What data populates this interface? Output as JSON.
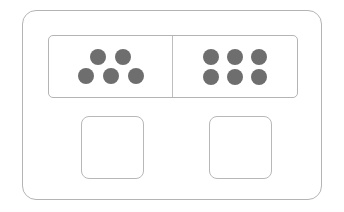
{
  "card": {
    "name": "dot-comparison-card",
    "border_color": "#b4b4b4",
    "background_color": "#ffffff"
  },
  "dot_strip": {
    "name": "dot-strip",
    "divider_color": "#bdbdbd",
    "dot_color": "#6e6e6e",
    "cells": [
      {
        "id": "left",
        "name": "left-dot-group",
        "count": 5,
        "rows": [
          {
            "dots": 2
          },
          {
            "dots": 3
          }
        ]
      },
      {
        "id": "right",
        "name": "right-dot-group",
        "count": 6,
        "rows": [
          {
            "dots": 3
          },
          {
            "dots": 3
          }
        ]
      }
    ]
  },
  "answer_boxes": [
    {
      "id": "left",
      "name": "left-answer-box",
      "value": "",
      "placeholder": "",
      "border_color": "#b8b8b8"
    },
    {
      "id": "right",
      "name": "right-answer-box",
      "value": "",
      "placeholder": "",
      "border_color": "#b8b8b8"
    }
  ]
}
